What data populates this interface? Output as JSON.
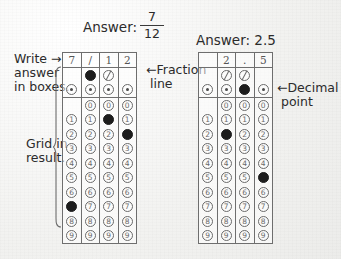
{
  "headings": {
    "answer_left_label": "Answer:",
    "answer_left_fraction_numerator": "7",
    "answer_left_fraction_denominator": "12",
    "answer_right": "Answer: 2.5"
  },
  "annotations": {
    "write_answer": "Write →\nanswer\nin boxes.",
    "grid_in_result": "Grid in\nresult.",
    "fraction_line": "←Fraction\n line",
    "decimal_point": "←Decimal\n point"
  },
  "grids": [
    {
      "name": "fraction-grid",
      "answer": "7/12",
      "handwritten": [
        "7",
        "/",
        "1",
        "2"
      ],
      "special_rows": [
        {
          "row_label": "fraction-line-row",
          "type": "slash",
          "cells": [
            {
              "present": false,
              "filled": false
            },
            {
              "present": true,
              "filled": true
            },
            {
              "present": true,
              "filled": false
            },
            {
              "present": false,
              "filled": false
            }
          ]
        },
        {
          "row_label": "decimal-point-row",
          "type": "dot",
          "cells": [
            {
              "present": true,
              "filled": false
            },
            {
              "present": true,
              "filled": false
            },
            {
              "present": true,
              "filled": false
            },
            {
              "present": true,
              "filled": false
            }
          ]
        }
      ],
      "digit_rows": [
        {
          "digit": "0",
          "cells": [
            false,
            true,
            true,
            true
          ],
          "filled": [
            false,
            false,
            false,
            false
          ]
        },
        {
          "digit": "1",
          "cells": [
            true,
            true,
            true,
            true
          ],
          "filled": [
            false,
            false,
            true,
            false
          ]
        },
        {
          "digit": "2",
          "cells": [
            true,
            true,
            true,
            true
          ],
          "filled": [
            false,
            false,
            false,
            true
          ]
        },
        {
          "digit": "3",
          "cells": [
            true,
            true,
            true,
            true
          ],
          "filled": [
            false,
            false,
            false,
            false
          ]
        },
        {
          "digit": "4",
          "cells": [
            true,
            true,
            true,
            true
          ],
          "filled": [
            false,
            false,
            false,
            false
          ]
        },
        {
          "digit": "5",
          "cells": [
            true,
            true,
            true,
            true
          ],
          "filled": [
            false,
            false,
            false,
            false
          ]
        },
        {
          "digit": "6",
          "cells": [
            true,
            true,
            true,
            true
          ],
          "filled": [
            false,
            false,
            false,
            false
          ]
        },
        {
          "digit": "7",
          "cells": [
            true,
            true,
            true,
            true
          ],
          "filled": [
            true,
            false,
            false,
            false
          ]
        },
        {
          "digit": "8",
          "cells": [
            true,
            true,
            true,
            true
          ],
          "filled": [
            false,
            false,
            false,
            false
          ]
        },
        {
          "digit": "9",
          "cells": [
            true,
            true,
            true,
            true
          ],
          "filled": [
            false,
            false,
            false,
            false
          ]
        }
      ]
    },
    {
      "name": "decimal-grid",
      "answer": "2.5",
      "handwritten": [
        "",
        "2",
        ".",
        "5"
      ],
      "special_rows": [
        {
          "row_label": "fraction-line-row",
          "type": "slash",
          "cells": [
            {
              "present": false,
              "filled": false
            },
            {
              "present": true,
              "filled": false
            },
            {
              "present": true,
              "filled": false
            },
            {
              "present": false,
              "filled": false
            }
          ]
        },
        {
          "row_label": "decimal-point-row",
          "type": "dot",
          "cells": [
            {
              "present": true,
              "filled": false
            },
            {
              "present": true,
              "filled": false
            },
            {
              "present": true,
              "filled": true
            },
            {
              "present": true,
              "filled": false
            }
          ]
        }
      ],
      "digit_rows": [
        {
          "digit": "0",
          "cells": [
            false,
            true,
            true,
            true
          ],
          "filled": [
            false,
            false,
            false,
            false
          ]
        },
        {
          "digit": "1",
          "cells": [
            true,
            true,
            true,
            true
          ],
          "filled": [
            false,
            false,
            false,
            false
          ]
        },
        {
          "digit": "2",
          "cells": [
            true,
            true,
            true,
            true
          ],
          "filled": [
            false,
            true,
            false,
            false
          ]
        },
        {
          "digit": "3",
          "cells": [
            true,
            true,
            true,
            true
          ],
          "filled": [
            false,
            false,
            false,
            false
          ]
        },
        {
          "digit": "4",
          "cells": [
            true,
            true,
            true,
            true
          ],
          "filled": [
            false,
            false,
            false,
            false
          ]
        },
        {
          "digit": "5",
          "cells": [
            true,
            true,
            true,
            true
          ],
          "filled": [
            false,
            false,
            false,
            true
          ]
        },
        {
          "digit": "6",
          "cells": [
            true,
            true,
            true,
            true
          ],
          "filled": [
            false,
            false,
            false,
            false
          ]
        },
        {
          "digit": "7",
          "cells": [
            true,
            true,
            true,
            true
          ],
          "filled": [
            false,
            false,
            false,
            false
          ]
        },
        {
          "digit": "8",
          "cells": [
            true,
            true,
            true,
            true
          ],
          "filled": [
            false,
            false,
            false,
            false
          ]
        },
        {
          "digit": "9",
          "cells": [
            true,
            true,
            true,
            true
          ],
          "filled": [
            false,
            false,
            false,
            false
          ]
        }
      ]
    }
  ],
  "colors": {
    "ink": "#2b2b2b",
    "rule": "#6e6e6e",
    "bubble_outline": "#6a6a6a",
    "bubble_filled": "#1d1d1d",
    "paper": "#f2f2f0"
  }
}
